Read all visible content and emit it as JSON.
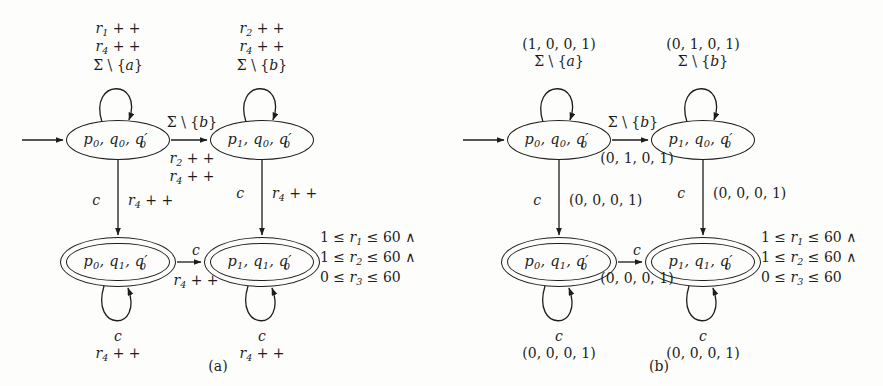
{
  "figure": {
    "width": 883,
    "height": 386,
    "background": "#fdfdfc",
    "ink": "#1d1d1d"
  },
  "panels": [
    {
      "id": "a",
      "caption": "(a)",
      "states": [
        {
          "id": "p0q0",
          "label": "p0, q0, q'0",
          "accepting": false,
          "x": 118,
          "y": 140
        },
        {
          "id": "p1q0",
          "label": "p1, q0, q'0",
          "accepting": false,
          "x": 262,
          "y": 140
        },
        {
          "id": "p0q1",
          "label": "p0, q1, q'0",
          "accepting": true,
          "x": 118,
          "y": 262
        },
        {
          "id": "p1q1",
          "label": "p1, q1, q'0",
          "accepting": true,
          "x": 262,
          "y": 262
        }
      ],
      "labels": [
        {
          "name": "loop-top-left",
          "lines": [
            "r1 + +",
            "r4 + +",
            "Σ \\ {a}"
          ],
          "x": 118,
          "y": 20
        },
        {
          "name": "loop-top-right",
          "lines": [
            "r2 + +",
            "r4 + +",
            "Σ \\ {b}"
          ],
          "x": 262,
          "y": 20
        },
        {
          "name": "edge-top-above",
          "lines": [
            "Σ \\ {b}"
          ],
          "x": 192,
          "y": 114
        },
        {
          "name": "edge-top-below",
          "lines": [
            "r2 + +",
            "r4 + +"
          ],
          "x": 192,
          "y": 150
        },
        {
          "name": "edge-left-guard",
          "lines": [
            "c"
          ],
          "x": 100,
          "y": 192
        },
        {
          "name": "edge-left-act",
          "lines": [
            "r4 + +"
          ],
          "x": 128,
          "y": 192
        },
        {
          "name": "edge-right-guard",
          "lines": [
            "c"
          ],
          "x": 244,
          "y": 185
        },
        {
          "name": "edge-right-act",
          "lines": [
            "r4 + +"
          ],
          "x": 272,
          "y": 185
        },
        {
          "name": "edge-bottom-above",
          "lines": [
            "c"
          ],
          "x": 196,
          "y": 242
        },
        {
          "name": "edge-bottom-below",
          "lines": [
            "r4 + +"
          ],
          "x": 196,
          "y": 272
        },
        {
          "name": "loop-bottom-left",
          "lines": [
            "c",
            "r4 + +"
          ],
          "x": 118,
          "y": 328
        },
        {
          "name": "loop-bottom-right",
          "lines": [
            "c",
            "r4 + +"
          ],
          "x": 262,
          "y": 328
        }
      ],
      "constraints": {
        "x": 320,
        "y": 228,
        "lines": [
          "1 ≤ r1 ≤ 60 ∧",
          "1 ≤ r2 ≤ 60 ∧",
          "0 ≤ r3 ≤ 60"
        ]
      },
      "caption_x": 218,
      "caption_y": 358
    },
    {
      "id": "b",
      "caption": "(b)",
      "states": [
        {
          "id": "p0q0",
          "label": "p0, q0, q'0",
          "accepting": false,
          "x": 118,
          "y": 140
        },
        {
          "id": "p1q0",
          "label": "p1, q0, q'0",
          "accepting": false,
          "x": 262,
          "y": 140
        },
        {
          "id": "p0q1",
          "label": "p0, q1, q'0",
          "accepting": true,
          "x": 118,
          "y": 262
        },
        {
          "id": "p1q1",
          "label": "p1, q1, q'0",
          "accepting": true,
          "x": 262,
          "y": 262
        }
      ],
      "labels": [
        {
          "name": "loop-top-left",
          "lines": [
            "(1, 0, 0, 1)",
            "Σ \\ {a}"
          ],
          "x": 118,
          "y": 36
        },
        {
          "name": "loop-top-right",
          "lines": [
            "(0, 1, 0, 1)",
            "Σ \\ {b}"
          ],
          "x": 262,
          "y": 36
        },
        {
          "name": "edge-top-above",
          "lines": [
            "Σ \\ {b}"
          ],
          "x": 192,
          "y": 114
        },
        {
          "name": "edge-top-below",
          "lines": [
            "(0, 1, 0, 1)"
          ],
          "x": 196,
          "y": 150
        },
        {
          "name": "edge-left-guard",
          "lines": [
            "c"
          ],
          "x": 100,
          "y": 192
        },
        {
          "name": "edge-left-act",
          "lines": [
            "(0, 0, 0, 1)"
          ],
          "x": 128,
          "y": 192
        },
        {
          "name": "edge-right-guard",
          "lines": [
            "c"
          ],
          "x": 244,
          "y": 185
        },
        {
          "name": "edge-right-act",
          "lines": [
            "(0, 0, 0, 1)"
          ],
          "x": 272,
          "y": 185
        },
        {
          "name": "edge-bottom-above",
          "lines": [
            "c"
          ],
          "x": 196,
          "y": 242
        },
        {
          "name": "edge-bottom-below",
          "lines": [
            "(0, 0, 0, 1)"
          ],
          "x": 196,
          "y": 270
        },
        {
          "name": "loop-bottom-left",
          "lines": [
            "c",
            "(0, 0, 0, 1)"
          ],
          "x": 118,
          "y": 328
        },
        {
          "name": "loop-bottom-right",
          "lines": [
            "c",
            "(0, 0, 0, 1)"
          ],
          "x": 262,
          "y": 328
        }
      ],
      "constraints": {
        "x": 320,
        "y": 228,
        "lines": [
          "1 ≤ r1 ≤ 60 ∧",
          "1 ≤ r2 ≤ 60 ∧",
          "0 ≤ r3 ≤ 60"
        ]
      },
      "caption_x": 218,
      "caption_y": 358
    }
  ]
}
